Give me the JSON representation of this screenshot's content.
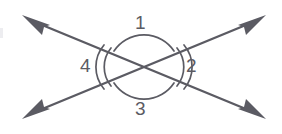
{
  "diagram": {
    "type": "geometry-figure",
    "background_color": "#ffffff",
    "stroke_color": "#5b5b63",
    "label_color": "#5b5b63",
    "intersection": {
      "x": 144,
      "y": 67
    },
    "lines": [
      {
        "name": "line-nw-se",
        "description": "double-headed arrow from upper-left to lower-right",
        "from": {
          "x": 24,
          "y": 18
        },
        "to": {
          "x": 264,
          "y": 116
        },
        "arrowhead_start": true,
        "arrowhead_end": true
      },
      {
        "name": "line-sw-ne",
        "description": "double-headed arrow from lower-left to upper-right",
        "from": {
          "x": 24,
          "y": 116
        },
        "to": {
          "x": 264,
          "y": 18
        },
        "arrowhead_start": true,
        "arrowhead_end": true
      }
    ],
    "arc_marks": [
      {
        "angle": "1",
        "position": "top",
        "count": 1,
        "radius": 36
      },
      {
        "angle": "3",
        "position": "bottom",
        "count": 1,
        "radius": 36
      },
      {
        "angle": "2",
        "position": "right",
        "count": 2,
        "radius": 30
      },
      {
        "angle": "4",
        "position": "left",
        "count": 2,
        "radius": 30
      }
    ],
    "labels": {
      "angle_1": "1",
      "angle_2": "2",
      "angle_3": "3",
      "angle_4": "4"
    }
  }
}
